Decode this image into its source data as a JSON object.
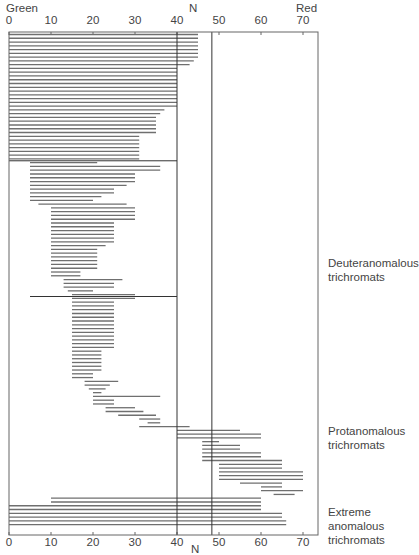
{
  "chart_data": {
    "type": "range-bar",
    "title": "",
    "top_axis": {
      "left_label": "Green",
      "center_label": "N",
      "right_label": "Red"
    },
    "xlabel": "N",
    "xlim": [
      0,
      73.5
    ],
    "xticks": [
      0,
      10,
      20,
      30,
      40,
      50,
      60,
      70
    ],
    "reference_lines": [
      40,
      48.3
    ],
    "group_dividers": [
      {
        "after_bar": 33,
        "x0": 0,
        "x1": 40
      },
      {
        "after_bar": 69,
        "x0": 5,
        "x1": 40
      }
    ],
    "groups": [
      {
        "label": "Deuteranomalous trichromats",
        "bars": "0-109"
      },
      {
        "label": "Protanomalous trichromats",
        "bars": "110-124"
      },
      {
        "label": "Extreme anomalous trichromats",
        "bars": "125-132"
      }
    ],
    "bars": [
      [
        0,
        45
      ],
      [
        0,
        45
      ],
      [
        0,
        45
      ],
      [
        0,
        45
      ],
      [
        0,
        45
      ],
      [
        0,
        45
      ],
      [
        0,
        45
      ],
      [
        0,
        44
      ],
      [
        0,
        43
      ],
      [
        0,
        40
      ],
      [
        0,
        40
      ],
      [
        0,
        40
      ],
      [
        0,
        40
      ],
      [
        0,
        40
      ],
      [
        0,
        40
      ],
      [
        0,
        40
      ],
      [
        0,
        40
      ],
      [
        0,
        40
      ],
      [
        0,
        40
      ],
      [
        0,
        40
      ],
      [
        0,
        37
      ],
      [
        0,
        36
      ],
      [
        0,
        35
      ],
      [
        0,
        35
      ],
      [
        0,
        35
      ],
      [
        0,
        35
      ],
      [
        0,
        35
      ],
      [
        0,
        31
      ],
      [
        0,
        31
      ],
      [
        0,
        31
      ],
      [
        0,
        31
      ],
      [
        0,
        31
      ],
      [
        0,
        31
      ],
      [
        0,
        31
      ],
      [
        5,
        21
      ],
      [
        5,
        36
      ],
      [
        5,
        36
      ],
      [
        5,
        30
      ],
      [
        5,
        30
      ],
      [
        5,
        30
      ],
      [
        5,
        28
      ],
      [
        5,
        25
      ],
      [
        5,
        25
      ],
      [
        5,
        22
      ],
      [
        5,
        20
      ],
      [
        7,
        28
      ],
      [
        10,
        30
      ],
      [
        10,
        30
      ],
      [
        10,
        30
      ],
      [
        10,
        30
      ],
      [
        10,
        25
      ],
      [
        10,
        25
      ],
      [
        10,
        25
      ],
      [
        10,
        25
      ],
      [
        10,
        25
      ],
      [
        10,
        25
      ],
      [
        10,
        23
      ],
      [
        10,
        21
      ],
      [
        10,
        21
      ],
      [
        10,
        21
      ],
      [
        10,
        21
      ],
      [
        10,
        21
      ],
      [
        10,
        21
      ],
      [
        10,
        17
      ],
      [
        10,
        17
      ],
      [
        13,
        27
      ],
      [
        13,
        25
      ],
      [
        13,
        25
      ],
      [
        14,
        20
      ],
      [
        15,
        30
      ],
      [
        15,
        30
      ],
      [
        15,
        25
      ],
      [
        15,
        25
      ],
      [
        15,
        25
      ],
      [
        15,
        25
      ],
      [
        15,
        25
      ],
      [
        15,
        25
      ],
      [
        15,
        25
      ],
      [
        15,
        25
      ],
      [
        15,
        25
      ],
      [
        15,
        25
      ],
      [
        15,
        25
      ],
      [
        15,
        25
      ],
      [
        15,
        25
      ],
      [
        15,
        22
      ],
      [
        15,
        22
      ],
      [
        15,
        22
      ],
      [
        15,
        22
      ],
      [
        15,
        22
      ],
      [
        15,
        22
      ],
      [
        15,
        20
      ],
      [
        15,
        20
      ],
      [
        18,
        26
      ],
      [
        18,
        24
      ],
      [
        19,
        23
      ],
      [
        20,
        22
      ],
      [
        20,
        36
      ],
      [
        20,
        25
      ],
      [
        20,
        25
      ],
      [
        23,
        30
      ],
      [
        23,
        32
      ],
      [
        26,
        35
      ],
      [
        31,
        36
      ],
      [
        33,
        36
      ],
      [
        31,
        43
      ],
      [
        40,
        55
      ],
      [
        40,
        60
      ],
      [
        40,
        60
      ],
      [
        46,
        50
      ],
      [
        46,
        55
      ],
      [
        46,
        55
      ],
      [
        46,
        60
      ],
      [
        46,
        60
      ],
      [
        46,
        65
      ],
      [
        50,
        65
      ],
      [
        50,
        65
      ],
      [
        50,
        70
      ],
      [
        50,
        70
      ],
      [
        50,
        70
      ],
      [
        55,
        65
      ],
      [
        60,
        65
      ],
      [
        60,
        70
      ],
      [
        63,
        68
      ],
      [
        10,
        60
      ],
      [
        10,
        60
      ],
      [
        0,
        60
      ],
      [
        0,
        60
      ],
      [
        0,
        65
      ],
      [
        0,
        65
      ],
      [
        0,
        66
      ],
      [
        0,
        66
      ]
    ]
  },
  "labels": {
    "green": "Green",
    "n_top": "N",
    "red": "Red",
    "n_bottom": "N",
    "group1_l1": "Deuteranomalous",
    "group1_l2": "trichromats",
    "group2_l1": "Protanomalous",
    "group2_l2": "trichromats",
    "group3_l1": "Extreme",
    "group3_l2": "anomalous",
    "group3_l3": "trichromats"
  },
  "colors": {
    "bar": "#6f6f6f",
    "frame": "#555555",
    "refline": "#333333",
    "text": "#444444"
  }
}
